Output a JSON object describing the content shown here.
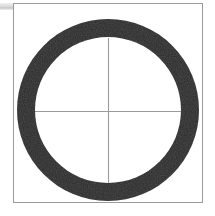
{
  "figure": {
    "title": "",
    "background_color": "#ffffff",
    "frame": {
      "label": "plot-frame",
      "x": 13,
      "y": 3,
      "width": 190,
      "height": 200,
      "stroke_color": "#9a9a9a",
      "stroke_width": 1
    },
    "corner_bar": {
      "label": "corner-bar",
      "x": 0,
      "y": 3,
      "width": 14,
      "height": 7,
      "color_start": "#f2f2f2",
      "color_end": "#c9c9c9"
    }
  },
  "chart_data": {
    "type": "scatter",
    "title": "",
    "subtitle": "",
    "xlabel": "",
    "ylabel": "",
    "grid": false,
    "legend": "none",
    "xlim": [
      13,
      203
    ],
    "ylim": [
      3,
      203
    ],
    "annotations": [
      {
        "name": "annulus",
        "shape": "ring",
        "center_x": 108,
        "center_y": 110,
        "outer_radius": 91,
        "inner_radius": 73,
        "thickness": 18,
        "fill_color": "#2b2b2b",
        "description": "thick dark ring / annulus"
      },
      {
        "name": "crosshair-vertical",
        "shape": "line",
        "x1": 108,
        "y1": 38,
        "x2": 108,
        "y2": 185,
        "stroke_color": "#9b9b9b",
        "stroke_width": 1
      },
      {
        "name": "crosshair-horizontal",
        "shape": "line",
        "x1": 35,
        "y1": 111,
        "x2": 181,
        "y2": 111,
        "stroke_color": "#9b9b9b",
        "stroke_width": 1
      }
    ]
  },
  "colors": {
    "ring": "#2b2b2b",
    "crosshair": "#9b9b9b",
    "frame": "#9a9a9a",
    "background": "#ffffff",
    "corner_bar": "#dcdcdc"
  }
}
